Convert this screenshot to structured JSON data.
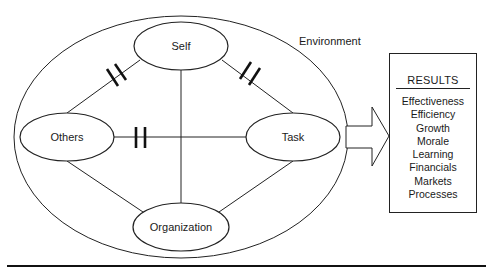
{
  "diagram": {
    "environment_label": "Environment",
    "nodes": {
      "self": "Self",
      "others": "Others",
      "task": "Task",
      "organization": "Organization"
    },
    "results": {
      "title": "RESULTS",
      "items": [
        "Effectiveness",
        "Efficiency",
        "Growth",
        "Morale",
        "Learning",
        "Financials",
        "Markets",
        "Processes"
      ]
    },
    "colors": {
      "stroke": "#222222",
      "background": "#ffffff",
      "text": "#1a1a1a"
    }
  }
}
